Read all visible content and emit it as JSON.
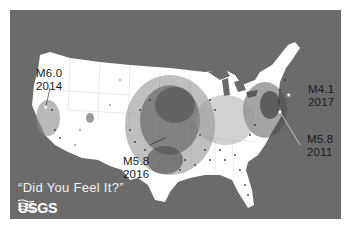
{
  "map": {
    "title": "Did You Feel It? responses across the conterminous United States",
    "colors": {
      "water": "#6b6b6b",
      "land": "#ffffff",
      "report_dots": "#3a3a3a",
      "label_text": "#1a1a1a",
      "tagline_text": "#f2f2f2"
    },
    "annotations": [
      {
        "id": "napa",
        "magnitude": "M6.0",
        "year": "2014"
      },
      {
        "id": "pawnee",
        "magnitude": "M5.8",
        "year": "2016"
      },
      {
        "id": "delaware",
        "magnitude": "M4.1",
        "year": "2017"
      },
      {
        "id": "virginia",
        "magnitude": "M5.8",
        "year": "2011"
      }
    ],
    "tagline": "“Did You Feel It?”",
    "logo": {
      "text": "USGS",
      "icon": "usgs-wave-icon"
    }
  }
}
